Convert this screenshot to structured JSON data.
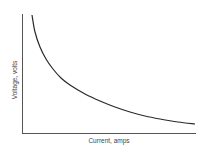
{
  "chart_data": {
    "type": "line",
    "title": "",
    "xlabel": "Current, amps",
    "ylabel": "Voltage, volts",
    "grid": false,
    "legend": null,
    "xticks": [],
    "yticks": [],
    "series": [
      {
        "name": "Voltage vs Current",
        "color": "#2a2a2a",
        "points_px": [
          [
            32,
            15
          ],
          [
            35,
            32
          ],
          [
            40,
            47
          ],
          [
            46,
            59
          ],
          [
            53,
            69
          ],
          [
            61,
            78
          ],
          [
            70,
            85
          ],
          [
            85,
            94
          ],
          [
            100,
            101
          ],
          [
            115,
            107
          ],
          [
            130,
            112
          ],
          [
            145,
            116
          ],
          [
            160,
            119
          ],
          [
            178,
            122
          ],
          [
            195,
            124
          ]
        ]
      }
    ],
    "axes_px": {
      "origin": [
        22,
        133
      ],
      "y_top": 14,
      "x_right": 196
    }
  },
  "labels": {
    "x_axis": "Current, amps",
    "y_axis": "Voltage, volts"
  }
}
